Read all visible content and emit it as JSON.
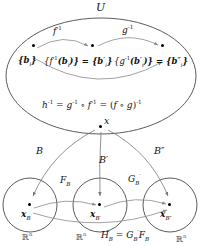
{
  "figure": {
    "title": "U",
    "universe_label": "U",
    "top_maps": {
      "f_inverse": "f",
      "f_inverse_exp": "-1",
      "g_inverse": "g",
      "g_inverse_exp": "-1"
    },
    "basis_sets": {
      "set1": "{b",
      "set1_sub": "i",
      "set1_close": "}",
      "set2_text": "{f",
      "set2_exp": "-1",
      "set2_mid": "(b",
      "set2_sub": "i",
      "set2_tail": ")} = {b",
      "set2_prime": "′",
      "set2_sub2": "i",
      "set2_close": "}",
      "set3_text": "{g",
      "set3_exp": "-1",
      "set3_mid": "(b",
      "set3_prime1": "′",
      "set3_sub": "i",
      "set3_tail": ")} = {b",
      "set3_prime2": "″",
      "set3_sub2": "i",
      "set3_close": "}"
    },
    "composition": {
      "h": "h",
      "h_exp": "-1",
      "eq1": " = ",
      "g": "g",
      "g_exp": "-1",
      "circ": " ∘ ",
      "f": "f",
      "f_exp": "-1",
      "eq2": " = (",
      "fg": "f ∘ g",
      "close_exp": ")",
      "close_exp_val": "-1"
    },
    "point_x": "x",
    "coordinate_maps": {
      "B": "B",
      "B_prime": "B",
      "B_prime_mark": "′",
      "B_dprime": "B",
      "B_dprime_mark": "″",
      "F_B": "F",
      "F_B_sub": "B",
      "G_Bp": "G",
      "G_Bp_sub": "B",
      "G_Bp_sub_prime": "′"
    },
    "circles": {
      "left": {
        "center_label": "x",
        "center_sub": "B",
        "space": "ℝ",
        "space_exp": "n"
      },
      "middle": {
        "center_label": "x",
        "center_sub": "B",
        "center_sub_prime": "′",
        "space": "ℝ",
        "space_exp": "n"
      },
      "right": {
        "center_label": "x",
        "center_sub": "B",
        "center_sub_prime": "″",
        "space": "ℝ",
        "space_exp": "n"
      }
    },
    "bottom_relation": {
      "H": "H",
      "H_sub": "B",
      "eq": " = ",
      "G": "G",
      "G_sub": "B",
      "G_sub_prime": "′",
      "F": "F",
      "F_sub": "B"
    },
    "colors": {
      "stroke": "#4a4a4a",
      "arrow": "#8a8a8a",
      "text": "#111111",
      "muted": "#555555",
      "background": "#ffffff"
    }
  }
}
